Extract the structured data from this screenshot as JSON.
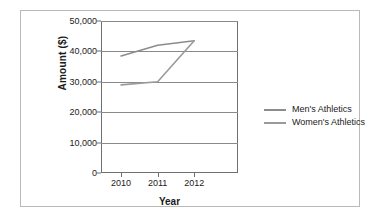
{
  "chart_data": {
    "type": "line",
    "title": "",
    "xlabel": "Year",
    "ylabel": "Amount ($)",
    "categories": [
      "2010",
      "2011",
      "2012"
    ],
    "x": [
      2010,
      2011,
      2012
    ],
    "ylim": [
      0,
      50000
    ],
    "yticks": [
      "0",
      "10,000",
      "20,000",
      "30,000",
      "40,000",
      "50,000"
    ],
    "ytick_values": [
      0,
      10000,
      20000,
      30000,
      40000,
      50000
    ],
    "grid": true,
    "legend_position": "right",
    "series": [
      {
        "name": "Men's Athletics",
        "values": [
          38500,
          42000,
          43500
        ],
        "color": "#8c8c8c"
      },
      {
        "name": "Women's Athletics",
        "values": [
          29000,
          30000,
          43500
        ],
        "color": "#9a9a9a"
      }
    ]
  },
  "axes": {
    "y_title": "Amount ($)",
    "x_title": "Year",
    "y_labels": [
      "50,000",
      "40,000",
      "30,000",
      "20,000",
      "10,000",
      "0"
    ],
    "x_labels": [
      "2010",
      "2011",
      "2012"
    ]
  },
  "legend": {
    "items": [
      {
        "label": "Men's Athletics",
        "color": "#8c8c8c"
      },
      {
        "label": "Women's Athletics",
        "color": "#9a9a9a"
      }
    ]
  },
  "colors": {
    "frame": "#6f6f6f",
    "gridline": "#8a8a8a",
    "outer_border": "#b9b9b9",
    "text": "#1a1a1a",
    "background": "#ffffff"
  }
}
